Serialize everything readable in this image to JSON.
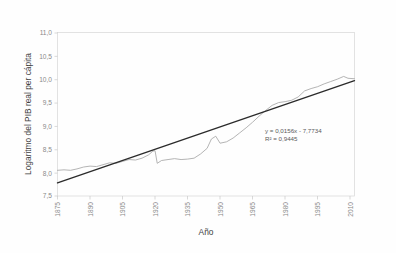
{
  "chart_data": {
    "type": "line",
    "title": "",
    "xlabel": "Año",
    "ylabel": "Logaritmo del PIB real per cápita",
    "xlim": [
      1875,
      2012
    ],
    "ylim": [
      7.5,
      11.0
    ],
    "grid": false,
    "legend": "none",
    "y_ticks": [
      "7,5",
      "8,0",
      "8,5",
      "9,0",
      "9,5",
      "10,0",
      "10,5",
      "11,0"
    ],
    "y_tick_values": [
      7.5,
      8.0,
      8.5,
      9.0,
      9.5,
      10.0,
      10.5,
      11.0
    ],
    "x_ticks": [
      "1875",
      "1890",
      "1905",
      "1920",
      "1935",
      "1950",
      "1965",
      "1980",
      "1995",
      "2010"
    ],
    "x_tick_values": [
      1875,
      1890,
      1905,
      1920,
      1935,
      1950,
      1965,
      1980,
      1995,
      2010
    ],
    "x_tick_rotation": -90,
    "annotations": [
      "y = 0,0156x - 7,7734",
      "R² = 0,9445"
    ],
    "series": [
      {
        "name": "Logaritmo del PIB real per cápita",
        "color": "#a6a6a6",
        "style": "line",
        "x": [
          1875,
          1878,
          1881,
          1884,
          1887,
          1890,
          1893,
          1896,
          1899,
          1902,
          1905,
          1908,
          1911,
          1914,
          1917,
          1919,
          1920,
          1921,
          1923,
          1926,
          1929,
          1932,
          1935,
          1938,
          1941,
          1944,
          1946,
          1948,
          1950,
          1953,
          1956,
          1959,
          1962,
          1965,
          1968,
          1971,
          1974,
          1977,
          1980,
          1983,
          1986,
          1989,
          1992,
          1995,
          1998,
          2001,
          2004,
          2007,
          2009,
          2012
        ],
        "y": [
          8.05,
          8.06,
          8.05,
          8.08,
          8.12,
          8.14,
          8.13,
          8.17,
          8.21,
          8.2,
          8.24,
          8.28,
          8.27,
          8.31,
          8.38,
          8.46,
          8.47,
          8.2,
          8.26,
          8.28,
          8.3,
          8.28,
          8.29,
          8.31,
          8.4,
          8.52,
          8.72,
          8.78,
          8.63,
          8.66,
          8.74,
          8.85,
          8.96,
          9.08,
          9.21,
          9.33,
          9.44,
          9.5,
          9.52,
          9.55,
          9.62,
          9.75,
          9.8,
          9.84,
          9.9,
          9.95,
          10.0,
          10.06,
          10.02,
          10.01
        ]
      },
      {
        "name": "Línea de tendencia lineal",
        "color": "#2b2b2b",
        "style": "trendline",
        "slope": 0.0156,
        "intercept": -7.7734,
        "r_squared": 0.9445,
        "equation": "y = 0,0156x - 7,7734",
        "x": [
          1875,
          2012
        ],
        "y": [
          7.78,
          9.97
        ]
      }
    ]
  },
  "axes": {
    "y_title": "Logaritmo del PIB real per cápita",
    "x_title": "Año"
  }
}
